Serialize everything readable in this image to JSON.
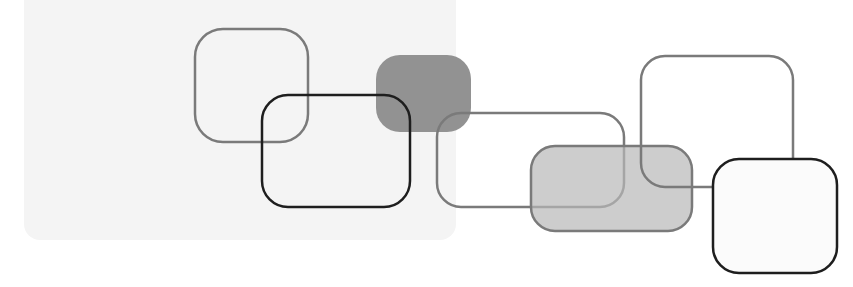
{
  "image": {
    "description": "Abstract decorative composition of overlapping rounded rectangles in grayscale",
    "width": 853,
    "height": 287
  },
  "colors": {
    "background": "#ffffff",
    "panel": "#f4f4f4",
    "stroke_gray": "#7a7a7a",
    "stroke_dark": "#1e1e1e",
    "fill_dark_gray": "#8c8c8c",
    "fill_light_gray": "#cfcfcf",
    "fill_white": "#fbfbfb"
  },
  "shapes": [
    {
      "id": "gray-outline-square",
      "x": 195,
      "y": 29,
      "w": 113,
      "h": 113,
      "r": 28,
      "fill": "none",
      "stroke": "#7a7a7a",
      "stroke_width": 2.5
    },
    {
      "id": "dark-outline-rect",
      "x": 262,
      "y": 95,
      "w": 148,
      "h": 112,
      "r": 26,
      "fill": "none",
      "stroke": "#1e1e1e",
      "stroke_width": 2.5
    },
    {
      "id": "dark-gray-filled",
      "x": 376,
      "y": 55,
      "w": 95,
      "h": 77,
      "r": 24,
      "fill": "#8c8c8c",
      "stroke": "none",
      "stroke_width": 0
    },
    {
      "id": "wide-gray-outline",
      "x": 437,
      "y": 113,
      "w": 187,
      "h": 94,
      "r": 24,
      "fill": "none",
      "stroke": "#7a7a7a",
      "stroke_width": 2.5
    },
    {
      "id": "tall-gray-outline",
      "x": 641,
      "y": 56,
      "w": 152,
      "h": 131,
      "r": 24,
      "fill": "none",
      "stroke": "#7a7a7a",
      "stroke_width": 2.5
    },
    {
      "id": "light-gray-filled",
      "x": 531,
      "y": 146,
      "w": 161,
      "h": 85,
      "r": 24,
      "fill": "#cccccc",
      "stroke": "#7a7a7a",
      "stroke_width": 2.5
    },
    {
      "id": "white-dark-outline",
      "x": 713,
      "y": 159,
      "w": 124,
      "h": 114,
      "r": 26,
      "fill": "#fbfbfb",
      "stroke": "#1e1e1e",
      "stroke_width": 2.5
    }
  ]
}
